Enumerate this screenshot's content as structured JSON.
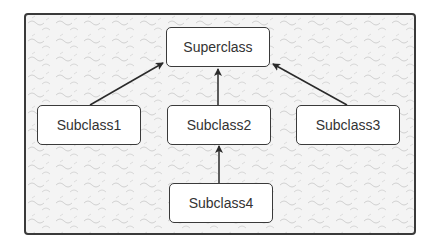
{
  "diagram": {
    "type": "class-inheritance",
    "nodes": [
      {
        "id": "superclass",
        "label": "Superclass"
      },
      {
        "id": "subclass1",
        "label": "Subclass1"
      },
      {
        "id": "subclass2",
        "label": "Subclass2"
      },
      {
        "id": "subclass3",
        "label": "Subclass3"
      },
      {
        "id": "subclass4",
        "label": "Subclass4"
      }
    ],
    "edges": [
      {
        "from": "Subclass1",
        "to": "Superclass"
      },
      {
        "from": "Subclass2",
        "to": "Superclass"
      },
      {
        "from": "Subclass3",
        "to": "Superclass"
      },
      {
        "from": "Subclass4",
        "to": "Subclass2"
      }
    ],
    "colors": {
      "stroke": "#3a3a3a",
      "background": "#f4f4f4",
      "node_fill": "#ffffff"
    }
  }
}
